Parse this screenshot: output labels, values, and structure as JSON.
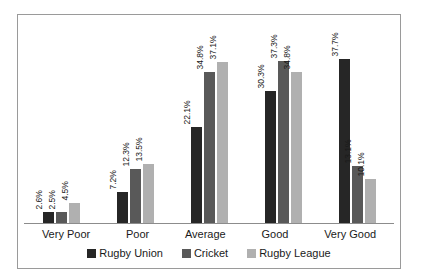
{
  "chart_data": {
    "type": "bar",
    "title": "",
    "subtitle": "",
    "xlabel": "",
    "ylabel": "",
    "categories": [
      "Very Poor",
      "Poor",
      "Average",
      "Good",
      "Very Good"
    ],
    "series": [
      {
        "name": "Rugby Union",
        "color": "#262626",
        "values": [
          2.6,
          7.2,
          22.1,
          30.3,
          37.7
        ],
        "labels": [
          "2.6%",
          "7.2%",
          "22.1%",
          "30.3%",
          "37.7%"
        ]
      },
      {
        "name": "Cricket",
        "color": "#595959",
        "values": [
          2.5,
          12.3,
          34.8,
          37.3,
          13.1
        ],
        "labels": [
          "2.5%",
          "12.3%",
          "34.8%",
          "37.3%",
          "13.1%"
        ]
      },
      {
        "name": "Rugby League",
        "color": "#b0b0b0",
        "values": [
          4.5,
          13.5,
          37.1,
          34.8,
          10.1
        ],
        "labels": [
          "4.5%",
          "13.5%",
          "37.1%",
          "34.8%",
          "10.1%"
        ]
      }
    ],
    "ylim": [
      0,
      42
    ],
    "grid": false,
    "value_labels_rotated": true,
    "legend_position": "bottom",
    "axis_line": true,
    "frame_border_color": "#9a9a9a",
    "background_color": "#ffffff"
  }
}
